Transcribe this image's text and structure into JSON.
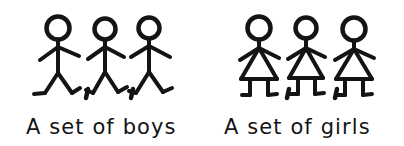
{
  "illustration": {
    "title": "Two sets of stick figures",
    "background_color": "#ffffff",
    "ink_color": "#141414",
    "stroke_width": 4
  },
  "groups": [
    {
      "id": "boys",
      "caption": "A set of boys",
      "member_count": 3,
      "figure_type": "stick-figure-boy",
      "separator": ",",
      "separator_count": 2,
      "members": [
        {
          "label": "boy-1",
          "head_cx": 58,
          "head_cy": 28,
          "head_r": 11
        },
        {
          "label": "boy-2",
          "head_cx": 105,
          "head_cy": 29,
          "head_r": 10
        },
        {
          "label": "boy-3",
          "head_cx": 149,
          "head_cy": 28,
          "head_r": 10
        }
      ]
    },
    {
      "id": "girls",
      "caption": "A set of girls",
      "member_count": 3,
      "figure_type": "stick-figure-girl",
      "separator": ",",
      "separator_count": 2,
      "members": [
        {
          "label": "girl-1",
          "head_cx": 259,
          "head_cy": 28,
          "head_r": 11
        },
        {
          "label": "girl-2",
          "head_cx": 306,
          "head_cy": 28,
          "head_r": 10
        },
        {
          "label": "girl-3",
          "head_cx": 354,
          "head_cy": 29,
          "head_r": 11
        }
      ]
    }
  ],
  "captions": {
    "boys_label": "A set of boys",
    "girls_label": "A set of girls",
    "boys_x": 26,
    "girls_x": 224,
    "baseline_y": 134
  },
  "separators": {
    "glyph": ",",
    "positions": [
      {
        "name": "boys-sep-1",
        "x": 87,
        "y": 97
      },
      {
        "name": "boys-sep-2",
        "x": 131,
        "y": 97
      },
      {
        "name": "girls-sep-1",
        "x": 288,
        "y": 97
      },
      {
        "name": "girls-sep-2",
        "x": 336,
        "y": 97
      }
    ]
  }
}
